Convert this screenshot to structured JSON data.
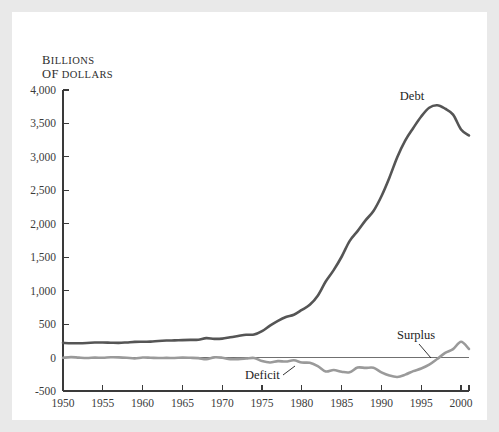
{
  "figure": {
    "background": "#e9e9e9",
    "panel_background": "#ffffff",
    "axis_unit_line1": "B",
    "axis_unit_line1_rest": "ILLIONS",
    "axis_unit_line2": "OF",
    "axis_unit_line2_rest": " DOLLARS"
  },
  "annotations": {
    "debt_label": "Debt",
    "deficit_label": "Deficit",
    "surplus_label": "Surplus"
  },
  "chart_data": {
    "type": "line",
    "title": "",
    "subtitle": "",
    "xlabel": "",
    "ylabel": "Billions of dollars",
    "xlim": [
      1950,
      2001
    ],
    "ylim": [
      -500,
      4000
    ],
    "yticks": [
      -500,
      0,
      500,
      1000,
      1500,
      2000,
      2500,
      3000,
      3500,
      4000
    ],
    "ytick_labels": [
      "-500",
      "0",
      "500",
      "1,000",
      "1,500",
      "2,000",
      "2,500",
      "3,000",
      "3,500",
      "4,000"
    ],
    "xticks": [
      1950,
      1955,
      1960,
      1965,
      1970,
      1975,
      1980,
      1985,
      1990,
      1995,
      2000
    ],
    "xtick_labels": [
      "1950",
      "1955",
      "1960",
      "1965",
      "1970",
      "1975",
      "1980",
      "1985",
      "1990",
      "1995",
      "2000"
    ],
    "grid": false,
    "legend_position": "inline-annotations",
    "zero_line": true,
    "colors": {
      "debt": "#555555",
      "deficit_surplus": "#9a9a9a",
      "axis": "#3a3a3a",
      "zero_line": "#707070"
    },
    "series": [
      {
        "name": "Debt",
        "color": "#555555",
        "stroke_width": 2.6,
        "x": [
          1950,
          1951,
          1952,
          1953,
          1954,
          1955,
          1956,
          1957,
          1958,
          1959,
          1960,
          1961,
          1962,
          1963,
          1964,
          1965,
          1966,
          1967,
          1968,
          1969,
          1970,
          1971,
          1972,
          1973,
          1974,
          1975,
          1976,
          1977,
          1978,
          1979,
          1980,
          1981,
          1982,
          1983,
          1984,
          1985,
          1986,
          1987,
          1988,
          1989,
          1990,
          1991,
          1992,
          1993,
          1994,
          1995,
          1996,
          1997,
          1998,
          1999,
          2000,
          2001
        ],
        "values": [
          219,
          214,
          214,
          218,
          224,
          226,
          222,
          219,
          226,
          235,
          237,
          238,
          248,
          254,
          257,
          261,
          264,
          267,
          290,
          279,
          283,
          303,
          322,
          341,
          344,
          395,
          477,
          549,
          607,
          640,
          712,
          789,
          925,
          1137,
          1307,
          1507,
          1741,
          1890,
          2051,
          2191,
          2412,
          2689,
          2999,
          3248,
          3433,
          3604,
          3734,
          3772,
          3721,
          3632,
          3410,
          3320
        ]
      },
      {
        "name": "Deficit / Surplus",
        "color": "#9a9a9a",
        "stroke_width": 2.6,
        "x": [
          1950,
          1951,
          1952,
          1953,
          1954,
          1955,
          1956,
          1957,
          1958,
          1959,
          1960,
          1961,
          1962,
          1963,
          1964,
          1965,
          1966,
          1967,
          1968,
          1969,
          1970,
          1971,
          1972,
          1973,
          1974,
          1975,
          1976,
          1977,
          1978,
          1979,
          1980,
          1981,
          1982,
          1983,
          1984,
          1985,
          1986,
          1987,
          1988,
          1989,
          1990,
          1991,
          1992,
          1993,
          1994,
          1995,
          1996,
          1997,
          1998,
          1999,
          2000,
          2001
        ],
        "values": [
          -3,
          6,
          -1,
          -6,
          -1,
          -3,
          4,
          3,
          -3,
          -13,
          0,
          -3,
          -7,
          -5,
          -6,
          -1,
          -4,
          -9,
          -25,
          3,
          -3,
          -23,
          -23,
          -15,
          -6,
          -53,
          -74,
          -54,
          -59,
          -41,
          -74,
          -79,
          -128,
          -208,
          -185,
          -212,
          -221,
          -150,
          -155,
          -153,
          -221,
          -269,
          -290,
          -255,
          -203,
          -164,
          -107,
          -22,
          69,
          126,
          236,
          128
        ]
      }
    ],
    "annotations": [
      {
        "text": "Debt",
        "series": "Debt",
        "at_x": 1996,
        "note": "points to peak of debt curve"
      },
      {
        "text": "Deficit",
        "series": "Deficit / Surplus",
        "at_x": 1978,
        "note": "leader line to deficit trough"
      },
      {
        "text": "Surplus",
        "series": "Deficit / Surplus",
        "at_x": 1999,
        "note": "leader line to surplus rise"
      }
    ]
  }
}
